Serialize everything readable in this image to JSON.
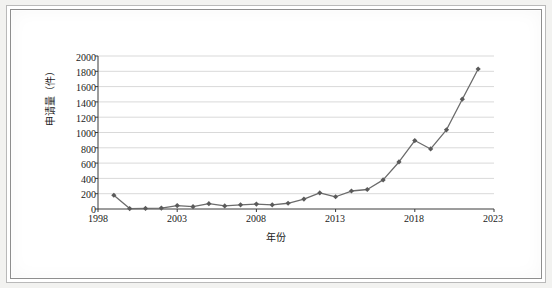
{
  "figure": {
    "kind": "scanned-line-chart",
    "frame_color": "#8e8e8e",
    "paper_color": "#ffffff"
  },
  "chart_data": {
    "type": "line",
    "title": "",
    "xlabel": "年份",
    "ylabel": "申请量（件）",
    "xlim": [
      1998,
      2023
    ],
    "ylim": [
      0,
      2000
    ],
    "ytick_step": 200,
    "grid": "horizontal",
    "legend": "none",
    "marker": "diamond",
    "line_color": "#6b6b6b",
    "marker_color": "#5a5a5a",
    "gridline_color": "#d9d9d9",
    "axis_color": "#3a3a3a",
    "xticks": [
      "1998",
      "2003",
      "2008",
      "2013",
      "2018",
      "2023"
    ],
    "yticks": [
      "0",
      "200",
      "400",
      "600",
      "800",
      "1000",
      "1200",
      "1400",
      "1600",
      "1800",
      "2000"
    ],
    "x": [
      1999,
      2000,
      2001,
      2002,
      2003,
      2004,
      2005,
      2006,
      2007,
      2008,
      2009,
      2010,
      2011,
      2012,
      2013,
      2014,
      2015,
      2016,
      2017,
      2018,
      2019,
      2020,
      2021,
      2022
    ],
    "values": [
      180,
      5,
      8,
      12,
      45,
      30,
      70,
      40,
      55,
      65,
      55,
      75,
      130,
      210,
      160,
      235,
      255,
      380,
      615,
      895,
      785,
      1035,
      1435,
      1830
    ],
    "series": [
      {
        "name": "申请量",
        "values": [
          180,
          5,
          8,
          12,
          45,
          30,
          70,
          40,
          55,
          65,
          55,
          75,
          130,
          210,
          160,
          235,
          255,
          380,
          615,
          895,
          785,
          1035,
          1435,
          1830
        ]
      }
    ]
  }
}
